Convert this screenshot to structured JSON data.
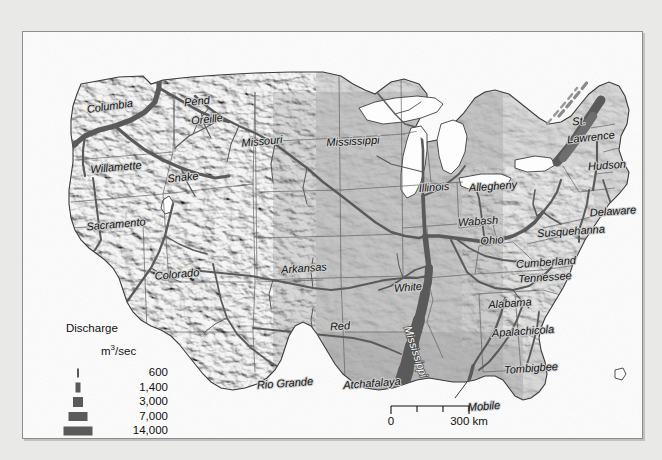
{
  "figure": {
    "background_color": "#e9e9e7",
    "plate_color": "#fdfdfd",
    "border_color": "#8d8d8d"
  },
  "map": {
    "land_color": "#9b9b9b",
    "water_color": "#ffffff",
    "river_color": "#5a5a5a",
    "state_border_color": "#6a6a6a",
    "coast_color": "#3d3d3d"
  },
  "legend": {
    "title": "Discharge",
    "unit_main": "m",
    "unit_sup": "3",
    "unit_rest": "/sec",
    "classes": [
      {
        "value": "600",
        "width": 2,
        "height": 9
      },
      {
        "value": "1,400",
        "width": 5,
        "height": 10
      },
      {
        "value": "3,000",
        "width": 10,
        "height": 10
      },
      {
        "value": "7,000",
        "width": 19,
        "height": 9
      },
      {
        "value": "14,000",
        "width": 29,
        "height": 9
      }
    ]
  },
  "scale_bar": {
    "start_label": "0",
    "end_label": "300 km",
    "ticks": 3
  },
  "river_labels": [
    {
      "name": "Columbia",
      "x": 87,
      "y": 75,
      "rot": -8,
      "size": "lg"
    },
    {
      "name": "Pend",
      "x": 174,
      "y": 70,
      "rot": -6,
      "size": "lg"
    },
    {
      "name": "Oreille",
      "x": 184,
      "y": 88,
      "rot": -6,
      "size": "lg"
    },
    {
      "name": "Missouri",
      "x": 239,
      "y": 110,
      "rot": -5,
      "size": "lg"
    },
    {
      "name": "Mississippi",
      "x": 330,
      "y": 110,
      "rot": -3,
      "size": "lg"
    },
    {
      "name": "Willamette",
      "x": 93,
      "y": 136,
      "rot": -5,
      "size": "lg"
    },
    {
      "name": "Snake",
      "x": 160,
      "y": 146,
      "rot": -6,
      "size": "lg"
    },
    {
      "name": "Illinois",
      "x": 411,
      "y": 156,
      "rot": -4,
      "size": "lg"
    },
    {
      "name": "Allegheny",
      "x": 470,
      "y": 155,
      "rot": -4,
      "size": "lg"
    },
    {
      "name": "St.",
      "x": 556,
      "y": 90,
      "rot": -6,
      "size": "lg"
    },
    {
      "name": "Lawrence",
      "x": 568,
      "y": 106,
      "rot": -6,
      "size": "lg"
    },
    {
      "name": "Hudson",
      "x": 584,
      "y": 134,
      "rot": -4,
      "size": "lg"
    },
    {
      "name": "Delaware",
      "x": 590,
      "y": 180,
      "rot": -4,
      "size": "lg"
    },
    {
      "name": "Wabash",
      "x": 455,
      "y": 190,
      "rot": -4,
      "size": "lg"
    },
    {
      "name": "Susquehanna",
      "x": 548,
      "y": 200,
      "rot": -4,
      "size": "lg"
    },
    {
      "name": "Sacramento",
      "x": 93,
      "y": 193,
      "rot": -5,
      "size": "lg"
    },
    {
      "name": "Ohio",
      "x": 469,
      "y": 209,
      "rot": -4,
      "size": "lg"
    },
    {
      "name": "Cumberland",
      "x": 523,
      "y": 231,
      "rot": -4,
      "size": "lg"
    },
    {
      "name": "Arkansas",
      "x": 281,
      "y": 237,
      "rot": -4,
      "size": "lg"
    },
    {
      "name": "Colorado",
      "x": 154,
      "y": 243,
      "rot": -5,
      "size": "lg"
    },
    {
      "name": "Tennessee",
      "x": 522,
      "y": 246,
      "rot": -4,
      "size": "lg"
    },
    {
      "name": "White",
      "x": 385,
      "y": 256,
      "rot": -4,
      "size": "lg"
    },
    {
      "name": "Alabama",
      "x": 487,
      "y": 272,
      "rot": -4,
      "size": "lg"
    },
    {
      "name": "Red",
      "x": 317,
      "y": 295,
      "rot": -4,
      "size": "lg"
    },
    {
      "name": "Apalachicola",
      "x": 500,
      "y": 300,
      "rot": -4,
      "size": "lg"
    },
    {
      "name": "Tombigbee",
      "x": 508,
      "y": 337,
      "rot": -4,
      "size": "lg"
    },
    {
      "name": "Rio Grande",
      "x": 262,
      "y": 352,
      "rot": -4,
      "size": "lg"
    },
    {
      "name": "Atchafalaya",
      "x": 349,
      "y": 352,
      "rot": -4,
      "size": "lg"
    },
    {
      "name": "Mobile",
      "x": 461,
      "y": 375,
      "rot": -4,
      "size": "lg"
    }
  ],
  "river_on_channel_labels": [
    {
      "name": "Mississippi",
      "x": 392,
      "y": 320,
      "rot": 72
    }
  ]
}
